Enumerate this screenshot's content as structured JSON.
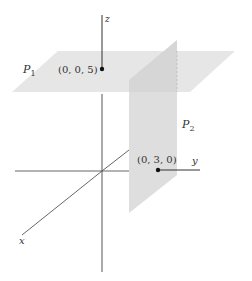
{
  "diagram": {
    "type": "3d-coordinate-planes",
    "axes": {
      "x_label": "x",
      "y_label": "y",
      "z_label": "z"
    },
    "planes": [
      {
        "id": "P1",
        "label": "P",
        "subscript": "1",
        "description": "horizontal plane z = 5"
      },
      {
        "id": "P2",
        "label": "P",
        "subscript": "2",
        "description": "vertical plane y = 3"
      }
    ],
    "points": [
      {
        "label": "(0, 0, 5)"
      },
      {
        "label": "(0, 3, 0)"
      }
    ],
    "colors": {
      "plane_p1": "#e4e4e4",
      "plane_p2": "#dcdcdc",
      "plane_p2_top": "#cfcfcf",
      "axis": "#444444",
      "point": "#111111"
    }
  }
}
